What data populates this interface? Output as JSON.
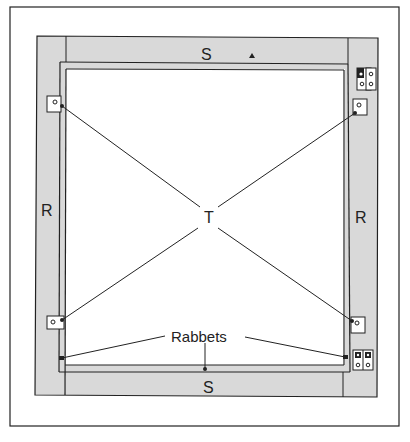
{
  "diagram": {
    "type": "technical-drawing",
    "colors": {
      "background": "#ffffff",
      "wood": "#d9d9d9",
      "line": "#222222",
      "plate": "#ffffff"
    },
    "labels": {
      "top_rail": "S",
      "bottom_rail": "S",
      "left_stile": "R",
      "right_stile": "R",
      "center": "T",
      "rabbets": "Rabbets"
    },
    "parts": [
      {
        "id": "S",
        "description": "top and bottom rails"
      },
      {
        "id": "R",
        "description": "left and right stiles"
      },
      {
        "id": "T",
        "description": "diagonal tension lines to corner plates"
      }
    ]
  }
}
